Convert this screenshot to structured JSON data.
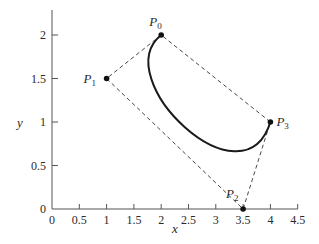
{
  "chart_data": {
    "type": "line",
    "title": "",
    "xlabel": "x",
    "ylabel": "y",
    "xlim": [
      0,
      4.5
    ],
    "ylim": [
      0,
      2.2
    ],
    "grid": false,
    "x_ticks": [
      0,
      0.5,
      1,
      1.5,
      2,
      2.5,
      3,
      3.5,
      4,
      4.5
    ],
    "x_tick_labels": [
      "0",
      "0.5",
      "1",
      "1.5",
      "2",
      "2.5",
      "3",
      "3.5",
      "4",
      "4.5"
    ],
    "y_ticks": [
      0,
      0.5,
      1,
      1.5,
      2
    ],
    "y_tick_labels": [
      "0",
      "0.5",
      "1",
      "1.5",
      "2"
    ],
    "control_points": [
      {
        "name": "P",
        "sub": "0",
        "x": 2,
        "y": 2
      },
      {
        "name": "P",
        "sub": "1",
        "x": 1,
        "y": 1.5
      },
      {
        "name": "P",
        "sub": "2",
        "x": 3.5,
        "y": 0
      },
      {
        "name": "P",
        "sub": "3",
        "x": 4,
        "y": 1
      }
    ],
    "series": [
      {
        "name": "control polygon",
        "style": "dashed",
        "x": [
          2,
          1,
          3.5,
          4,
          2
        ],
        "y": [
          2,
          1.5,
          0,
          1,
          2
        ]
      },
      {
        "name": "cubic Bezier curve",
        "style": "solid",
        "curve": "cubic-bezier",
        "points": [
          [
            2,
            2
          ],
          [
            1,
            1.5
          ],
          [
            3.5,
            0
          ],
          [
            4,
            1
          ]
        ]
      }
    ]
  },
  "labels": {
    "x_axis": "x",
    "y_axis": "y"
  }
}
